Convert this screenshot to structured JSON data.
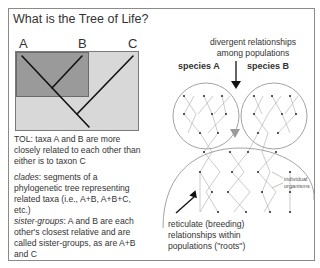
{
  "title": "What is the Tree of Life?",
  "tree": {
    "labels": [
      "A",
      "B",
      "C"
    ]
  },
  "definitions": {
    "tol": "TOL: taxa A and B are more closely related to each other than either is to taxon C",
    "clades_term": "clades",
    "clades_text": ": segments of a phylogenetic tree representing related taxa (i.e., A+B, A+B+C, etc.)",
    "sister_term": "sister-groups",
    "sister_text": ": A and B are each other's closest relative and are called sister-groups, as are A+B and C"
  },
  "right_diagram": {
    "top_caption_line1": "divergent relationships",
    "top_caption_line2": "among populations",
    "species_a": "species A",
    "species_b": "species B",
    "individual_line1": "individual",
    "individual_line2": "organisms",
    "bottom_caption_line1": "reticulate (breeding)",
    "bottom_caption_line2": "relationships within",
    "bottom_caption_line3": "populations (\"roots\")"
  },
  "colors": {
    "outer_box": "#d8d8d8",
    "inner_box": "#9a9a9a",
    "frame": "#8a8a8a",
    "triangle": "#999999"
  }
}
